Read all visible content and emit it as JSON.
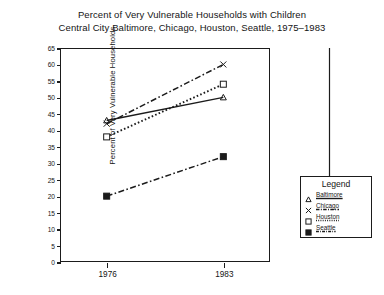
{
  "chart_data": {
    "type": "line",
    "title": "Percent of Very Vulnerable Households with Children",
    "subtitle": "Central City Baltimore, Chicago, Houston, Seattle, 1975–1983",
    "xlabel": "",
    "ylabel": "Percent of Very Vulnerable Households",
    "categories": [
      "1976",
      "1983"
    ],
    "x": [
      1976,
      1983
    ],
    "xlim": [
      1973.2,
      1985.8
    ],
    "ylim": [
      0,
      65
    ],
    "yticks": [
      "0",
      "5",
      "10",
      "15",
      "20",
      "25",
      "30",
      "35",
      "40",
      "45",
      "50",
      "55",
      "60",
      "65"
    ],
    "ytick_values": [
      0,
      5,
      10,
      15,
      20,
      25,
      30,
      35,
      40,
      45,
      50,
      55,
      60,
      65
    ],
    "xticks": [
      "1976",
      "1983"
    ],
    "grid": false,
    "legend_position": "bottom-right",
    "series": [
      {
        "name": "Baltimore",
        "marker": "triangle",
        "line_style": "solid",
        "values": [
          43,
          50
        ]
      },
      {
        "name": "Chicago",
        "marker": "cross",
        "line_style": "dash-dot",
        "values": [
          42,
          60
        ]
      },
      {
        "name": "Houston",
        "marker": "square",
        "line_style": "dotted",
        "values": [
          38,
          54
        ]
      },
      {
        "name": "Seattle",
        "marker": "filled-square",
        "line_style": "dash-dot",
        "values": [
          20,
          32
        ]
      }
    ]
  },
  "legend": {
    "title": "Legend",
    "entries": [
      {
        "label": "Baltimore",
        "marker": "triangle"
      },
      {
        "label": "Chicago",
        "marker": "cross"
      },
      {
        "label": "Houston",
        "marker": "square"
      },
      {
        "label": "Seattle",
        "marker": "filled-square"
      }
    ]
  },
  "colors": {
    "ink": "#1b1b1b",
    "background": "#ffffff"
  }
}
